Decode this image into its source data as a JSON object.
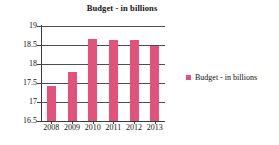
{
  "chart_data": {
    "type": "bar",
    "title": "Budget - in billions",
    "xlabel": "",
    "ylabel": "",
    "categories": [
      "2008",
      "2009",
      "2010",
      "2011",
      "2012",
      "2013"
    ],
    "values": [
      17.42,
      17.78,
      18.66,
      18.63,
      18.62,
      18.47
    ],
    "series": [
      {
        "name": "Budget - in billions",
        "values": [
          17.42,
          17.78,
          18.66,
          18.63,
          18.62,
          18.47
        ],
        "color": "#e2527a"
      }
    ],
    "ylim": [
      16.5,
      19.0
    ],
    "ytick_labels": [
      "19",
      "18.5",
      "18",
      "17.5",
      "17",
      "16.5"
    ],
    "ytick_values": [
      19,
      18.5,
      18,
      17.5,
      17,
      16.5
    ],
    "grid": true,
    "grid_color": "#4c4c4c",
    "legend": {
      "position": "right",
      "entries": [
        {
          "label": "Budget - in billions",
          "color": "#e2527a"
        }
      ]
    },
    "background": "#ffffff"
  }
}
